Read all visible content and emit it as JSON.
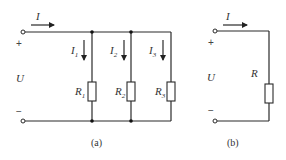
{
  "figure_a": {
    "caption": "(a)",
    "current_total": "I",
    "voltage": "U",
    "plus": "+",
    "minus": "−",
    "branches": [
      {
        "current": "I",
        "current_sub": "1",
        "resistor": "R",
        "resistor_sub": "1"
      },
      {
        "current": "I",
        "current_sub": "2",
        "resistor": "R",
        "resistor_sub": "2"
      },
      {
        "current": "I",
        "current_sub": "3",
        "resistor": "R",
        "resistor_sub": "3"
      }
    ]
  },
  "figure_b": {
    "caption": "(b)",
    "current_total": "I",
    "voltage": "U",
    "plus": "+",
    "minus": "−",
    "resistor": "R"
  }
}
